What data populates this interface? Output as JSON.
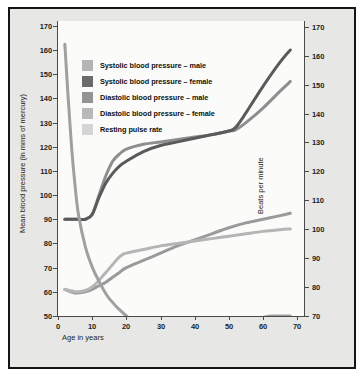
{
  "chart_data": {
    "type": "line",
    "title": "",
    "xlabel": "Age in years",
    "ylabel": "Mean blood pressure (in mms of mercury)",
    "y2label": "Beats per minute",
    "xlim": [
      0,
      72
    ],
    "ylim": [
      50,
      172
    ],
    "y2lim": [
      70,
      172
    ],
    "grid": false,
    "legend_position": "upper-left-inside",
    "xticks": [
      0,
      10,
      20,
      30,
      40,
      50,
      60,
      70
    ],
    "yticks": [
      50,
      60,
      70,
      80,
      90,
      100,
      110,
      120,
      130,
      140,
      150,
      160,
      170
    ],
    "y2ticks": [
      70,
      80,
      90,
      100,
      110,
      120,
      130,
      140,
      150,
      160,
      170
    ],
    "series": [
      {
        "name": "Systolic blood pressure – male",
        "color": "#8e8e8e",
        "axis": "left",
        "x": [
          2,
          4,
          6,
          8,
          10,
          12,
          14,
          16,
          18,
          20,
          25,
          30,
          35,
          40,
          45,
          50,
          52,
          55,
          60,
          65,
          68
        ],
        "values": [
          90,
          90,
          90,
          90,
          92,
          100,
          108,
          114,
          117,
          119,
          121,
          122,
          123,
          124,
          125,
          126.5,
          127,
          130,
          136,
          143,
          147
        ]
      },
      {
        "name": "Systolic blood pressure – female",
        "color": "#5a5a5a",
        "axis": "left",
        "x": [
          2,
          4,
          6,
          8,
          10,
          12,
          14,
          16,
          18,
          20,
          25,
          30,
          35,
          40,
          45,
          50,
          52,
          55,
          60,
          65,
          68
        ],
        "values": [
          90,
          90,
          90,
          90,
          92,
          99,
          105,
          109,
          112,
          114,
          118,
          120.5,
          122,
          123.5,
          125,
          126.5,
          128,
          134,
          145,
          155,
          160
        ]
      },
      {
        "name": "Diastolic blood pressure – male",
        "color": "#9a9a9a",
        "axis": "left",
        "x": [
          2,
          5,
          8,
          10,
          12,
          14,
          16,
          18,
          20,
          25,
          30,
          35,
          40,
          45,
          50,
          55,
          60,
          65,
          68
        ],
        "values": [
          61,
          59.5,
          60,
          61,
          62.5,
          64,
          66,
          68,
          70,
          73,
          76,
          79,
          81.5,
          84,
          86.5,
          88.5,
          90,
          91.5,
          92.5
        ]
      },
      {
        "name": "Diastolic blood pressure – female",
        "color": "#b5b5b5",
        "axis": "left",
        "x": [
          2,
          6,
          10,
          14,
          17,
          18,
          19,
          20,
          25,
          30,
          35,
          40,
          45,
          50,
          55,
          60,
          65,
          68
        ],
        "values": [
          61,
          60,
          62,
          68,
          73,
          74.5,
          75.5,
          76,
          77.5,
          79,
          80,
          81,
          82,
          83,
          84,
          85,
          85.7,
          86
        ]
      },
      {
        "name": "Resting pulse rate",
        "color": "#a0a0a0",
        "axis": "right",
        "x": [
          2,
          3,
          4,
          5,
          6,
          8,
          10,
          12,
          15,
          20,
          25,
          30,
          35,
          40,
          45,
          50,
          55,
          60,
          63,
          65,
          67,
          68
        ],
        "values": [
          164,
          145,
          128,
          115,
          105,
          94,
          87,
          82,
          76,
          70,
          66,
          63,
          61.5,
          61.5,
          62.5,
          64,
          66.5,
          69.5,
          70,
          70,
          70,
          70
        ]
      }
    ]
  },
  "legend": {
    "items": [
      {
        "label": "Systolic blood pressure – male",
        "color": "#b4b4b4"
      },
      {
        "label": "Systolic blood pressure – female",
        "color": "#6b6b6b"
      },
      {
        "label": "Diastolic blood pressure – male",
        "color": "#949494"
      },
      {
        "label": "Diastolic blood pressure – female",
        "color": "#b9b9b9"
      },
      {
        "label": "Resting pulse rate",
        "color": "#d4d4d4"
      }
    ]
  },
  "axes": {
    "left": {
      "title": "Mean blood pressure (in mms of mercury)",
      "labels": [
        "170",
        "160",
        "150",
        "140",
        "130",
        "120",
        "110",
        "100",
        "90",
        "80",
        "70",
        "60",
        "50"
      ]
    },
    "right": {
      "title": "Beats per minute",
      "labels": [
        "170",
        "160",
        "150",
        "140",
        "130",
        "120",
        "110",
        "100",
        "90",
        "80",
        "70"
      ]
    },
    "bottom": {
      "title": "Age in years",
      "labels": [
        "0",
        "10",
        "20",
        "30",
        "40",
        "50",
        "60",
        "70"
      ]
    }
  },
  "colors": {
    "frame_border": "#151515",
    "margin_background": "#e7e7e5",
    "plot_background": "#fbfbfa",
    "axis": "#4a4a4a",
    "text": "#1d1d1d"
  }
}
